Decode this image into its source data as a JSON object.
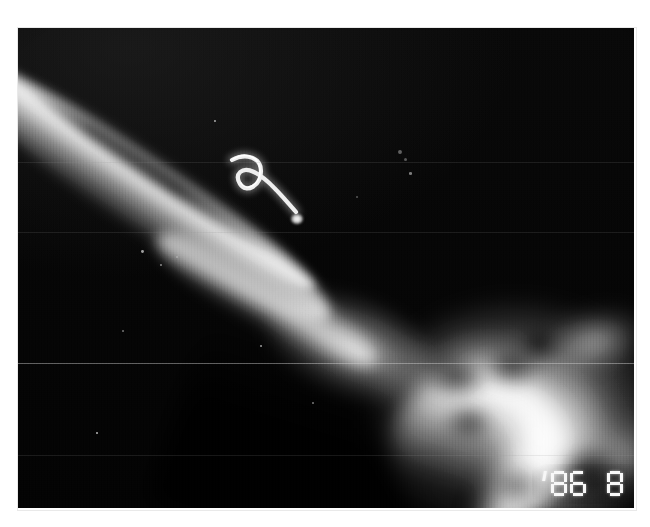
{
  "document": {
    "type": "radiograph-photograph",
    "medium": "black-and-white x-ray film photograph",
    "alt_text": "Grainy black and white radiograph showing a diagonal long bone shaft running from upper left to lower right, a bright curved hook shaped wire positioned over the soft tissue, and a large bright rounded mineralised mass at the lower right. A burned in date stamp reads '86 8 2."
  },
  "plate": {
    "background_color": "#050505",
    "bone_color": "#d2d2d2",
    "implant_color": "#f2f2f2",
    "border_color": "#e9e9e9",
    "margin_color": "#ffffff"
  },
  "features": [
    {
      "name": "long-bone-shaft",
      "label": "Diagonal long bone shaft",
      "location": "upper-left to centre"
    },
    {
      "name": "curved-wire-implant",
      "label": "Curved hook shaped radiopaque wire",
      "location": "upper-middle"
    },
    {
      "name": "radiopaque-mass",
      "label": "Large bright rounded mass",
      "location": "lower-right"
    }
  ],
  "datestamp": {
    "name": "camera-date-stamp",
    "text": "'86 8 2",
    "apostrophe": "'",
    "year": "86",
    "month": "8",
    "day": "2",
    "color": "#f6f6f6",
    "segments": {
      "0": "abcdef",
      "1": "bc",
      "2": "abged",
      "3": "abgcd",
      "4": "fgbc",
      "5": "afgcd",
      "6": "afgedc",
      "7": "abc",
      "8": "abcdefg",
      "9": "abcdfg"
    }
  },
  "scanlines": [
    {
      "y": 162,
      "strength": "weak"
    },
    {
      "y": 232,
      "strength": "weak"
    },
    {
      "y": 363,
      "strength": "strong"
    },
    {
      "y": 455,
      "strength": "weak"
    }
  ],
  "specks": [
    {
      "x": 398,
      "y": 150,
      "r": 2.2
    },
    {
      "x": 404,
      "y": 158,
      "r": 1.6
    },
    {
      "x": 409,
      "y": 172,
      "r": 1.3
    },
    {
      "x": 356,
      "y": 196,
      "r": 1.1
    },
    {
      "x": 141,
      "y": 250,
      "r": 1.4
    },
    {
      "x": 160,
      "y": 264,
      "r": 1.2
    },
    {
      "x": 176,
      "y": 256,
      "r": 1.0
    },
    {
      "x": 122,
      "y": 330,
      "r": 1.0
    },
    {
      "x": 260,
      "y": 345,
      "r": 1.1
    },
    {
      "x": 312,
      "y": 402,
      "r": 1.0
    },
    {
      "x": 96,
      "y": 432,
      "r": 1.0
    },
    {
      "x": 214,
      "y": 120,
      "r": 1.0
    }
  ]
}
